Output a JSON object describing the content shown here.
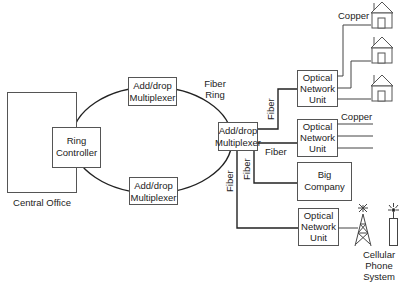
{
  "diagram": {
    "central_office": {
      "label": "Central Office"
    },
    "ring_controller": {
      "line1": "Ring",
      "line2": "Controller"
    },
    "mux_top": {
      "line1": "Add/drop",
      "line2": "Multiplexer"
    },
    "mux_bottom": {
      "line1": "Add/drop",
      "line2": "Multiplexer"
    },
    "mux_right": {
      "line1": "Add/drop",
      "line2": "Multiplexer"
    },
    "ring_label": {
      "line1": "Fiber",
      "line2": "Ring"
    },
    "onu_homes": {
      "line1": "Optical",
      "line2": "Network",
      "line3": "Unit"
    },
    "onu_copper": {
      "line1": "Optical",
      "line2": "Network",
      "line3": "Unit"
    },
    "onu_cellular": {
      "line1": "Optical",
      "line2": "Network",
      "line3": "Unit"
    },
    "big_company": {
      "line1": "Big",
      "line2": "Company"
    },
    "labels": {
      "copper_homes": "Copper",
      "copper_lines": "Copper",
      "fiber_up": "Fiber",
      "fiber_horizontal": "Fiber",
      "fiber_company": "Fiber",
      "fiber_down": "Fiber"
    },
    "cellular": {
      "line1": "Cellular",
      "line2": "Phone",
      "line3": "System"
    },
    "colors": {
      "line": "#222222",
      "box_border": "#555555",
      "background": "#ffffff"
    }
  }
}
